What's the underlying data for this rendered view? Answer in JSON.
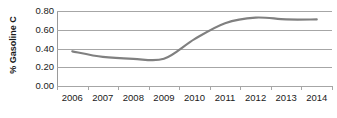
{
  "chart_data": {
    "type": "line",
    "title": "",
    "subtitle": "",
    "xlabel": "",
    "ylabel": "% Gasoline C",
    "categories": [
      "2006",
      "2007",
      "2008",
      "2009",
      "2010",
      "2011",
      "2012",
      "2013",
      "2014"
    ],
    "x": [
      2006,
      2007,
      2008,
      2009,
      2010,
      2011,
      2012,
      2013,
      2014
    ],
    "values": [
      0.37,
      0.31,
      0.29,
      0.29,
      0.5,
      0.67,
      0.73,
      0.71,
      0.71
    ],
    "series": [
      {
        "name": "% Gasoline C",
        "values": [
          0.37,
          0.31,
          0.29,
          0.29,
          0.5,
          0.67,
          0.73,
          0.71,
          0.71
        ],
        "color": "#808080",
        "smooth": true,
        "line_width": 2.2,
        "markers": false
      }
    ],
    "ylim": [
      0.0,
      0.8
    ],
    "ytick_values": [
      0.0,
      0.2,
      0.4,
      0.6,
      0.8
    ],
    "ytick_labels": [
      "0.00",
      "0.20",
      "0.40",
      "0.60",
      "0.80"
    ],
    "xlim": [
      2005.5,
      2014.5
    ],
    "grid": {
      "horizontal": true,
      "vertical": false,
      "color": "#a6a6a6"
    },
    "legend": {
      "visible": false,
      "position": "none",
      "entries": []
    },
    "axis": {
      "y_axis_line_visible": true,
      "x_axis_line_visible": false,
      "tick_marks": "outside",
      "tick_color": "#a6a6a6"
    },
    "annotations": [],
    "background_color": "#ffffff",
    "text_color": "#1a1a1a"
  }
}
